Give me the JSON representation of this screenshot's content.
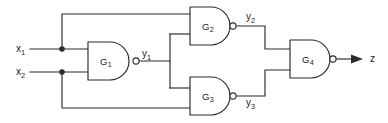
{
  "figure": {
    "type": "logic-circuit-diagram",
    "background_color": "#ffffff",
    "line_color": "#2b2b2b"
  },
  "inputs": [
    {
      "name": "x1",
      "base": "x",
      "subscript": "1",
      "x": 16,
      "y": 52,
      "wire_y": 49
    },
    {
      "name": "x2",
      "base": "x",
      "subscript": "2",
      "x": 16,
      "y": 75,
      "wire_y": 72
    }
  ],
  "gates": [
    {
      "id": "G1",
      "base": "G",
      "subscript": "1",
      "type": "NAND",
      "label_x": 106,
      "label_y": 65,
      "box": {
        "x": 88,
        "y": 42,
        "w": 45,
        "h": 38
      },
      "output_signal": "y1"
    },
    {
      "id": "G2",
      "base": "G",
      "subscript": "2",
      "type": "NAND",
      "label_x": 208,
      "label_y": 30,
      "box": {
        "x": 190,
        "y": 7,
        "w": 40,
        "h": 38
      },
      "output_signal": "y2"
    },
    {
      "id": "G3",
      "base": "G",
      "subscript": "3",
      "type": "NAND",
      "label_x": 208,
      "label_y": 100,
      "box": {
        "x": 190,
        "y": 77,
        "w": 40,
        "h": 38
      },
      "output_signal": "y3"
    },
    {
      "id": "G4",
      "base": "G",
      "subscript": "4",
      "type": "NAND",
      "label_x": 308,
      "label_y": 63,
      "box": {
        "x": 290,
        "y": 40,
        "w": 40,
        "h": 38
      },
      "output_signal": "z"
    }
  ],
  "signals": [
    {
      "name": "y1",
      "base": "y",
      "subscript": "1",
      "x": 142,
      "y": 57
    },
    {
      "name": "y2",
      "base": "y",
      "subscript": "2",
      "x": 246,
      "y": 20
    },
    {
      "name": "y3",
      "base": "y",
      "subscript": "3",
      "x": 246,
      "y": 106
    },
    {
      "name": "z",
      "base": "z",
      "subscript": "",
      "x": 370,
      "y": 62
    }
  ],
  "junctions": [
    {
      "name": "x1-branch-node",
      "x": 62,
      "y": 49
    },
    {
      "name": "x2-branch-node",
      "x": 62,
      "y": 72
    }
  ],
  "output": {
    "name": "z",
    "label": "z",
    "arrow_tip_x": 363,
    "wire_y": 59
  }
}
